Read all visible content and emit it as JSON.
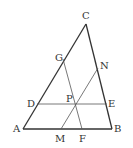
{
  "figure": {
    "type": "triangle-geometry",
    "points": {
      "A": {
        "label": "A",
        "x": 23,
        "y": 129
      },
      "B": {
        "label": "B",
        "x": 112,
        "y": 129
      },
      "C": {
        "label": "C",
        "x": 86,
        "y": 24
      },
      "D": {
        "label": "D",
        "x": 37,
        "y": 104
      },
      "E": {
        "label": "E",
        "x": 107,
        "y": 104
      },
      "P": {
        "label": "P",
        "x": 75,
        "y": 104
      },
      "M": {
        "label": "M",
        "x": 61,
        "y": 129
      },
      "F": {
        "label": "F",
        "x": 82,
        "y": 129
      },
      "G": {
        "label": "G",
        "x": 63,
        "y": 59
      },
      "N": {
        "label": "N",
        "x": 98,
        "y": 68
      }
    },
    "segments": [
      [
        "A",
        "B"
      ],
      [
        "B",
        "C"
      ],
      [
        "C",
        "A"
      ],
      [
        "D",
        "E"
      ],
      [
        "G",
        "F"
      ],
      [
        "M",
        "N"
      ]
    ],
    "line_color": "#333333",
    "label_color": "#333333"
  }
}
